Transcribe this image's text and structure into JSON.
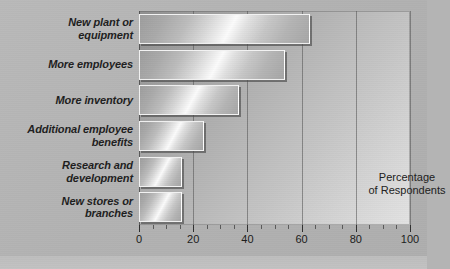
{
  "figure": {
    "top_caption": "",
    "background_color": "#b4b4b4",
    "plot_area_color": "#b6b6b6",
    "bar_fill_color": "#cfcfcf",
    "bar_border_color": "#f2f2f2",
    "bar_shadow_color": "#464646",
    "gridline_color": "#505050",
    "text_color": "#1d1d1d"
  },
  "chart_data": {
    "type": "bar",
    "orientation": "horizontal",
    "title": "",
    "subtitle": "",
    "xlabel": "",
    "ylabel": "",
    "annotation": "Percentage\nof Respondents",
    "annotation_lines": [
      "Percentage",
      "of Respondents"
    ],
    "categories": [
      "New plant or equipment",
      "More employees",
      "More inventory",
      "Additional employee benefits",
      "Research and development",
      "New stores or branches"
    ],
    "category_lines": [
      [
        "New plant or",
        "equipment"
      ],
      [
        "More employees"
      ],
      [
        "More inventory"
      ],
      [
        "Additional employee",
        "benefits"
      ],
      [
        "Research and",
        "development"
      ],
      [
        "New stores or",
        "branches"
      ]
    ],
    "values": [
      63,
      54,
      37,
      24,
      16,
      16
    ],
    "xlim": [
      0,
      100
    ],
    "xticks": [
      0,
      20,
      40,
      60,
      80,
      100
    ],
    "xtick_labels": [
      "0",
      "20",
      "40",
      "60",
      "80",
      "100"
    ],
    "minor_tick_interval": 5,
    "grid": true,
    "grid_axis": "x",
    "legend": false
  }
}
